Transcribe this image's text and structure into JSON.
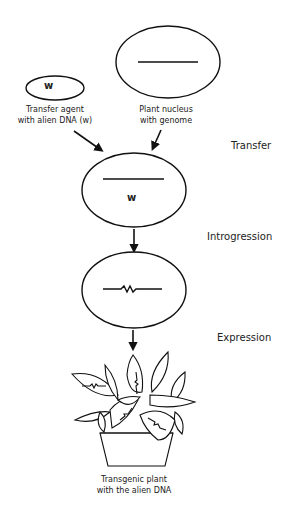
{
  "diagram": {
    "type": "process-flow",
    "nodes": {
      "transfer_agent": {
        "symbol": "w",
        "label_line1": "Transfer agent",
        "label_line2": "with alien DNA (w)"
      },
      "plant_nucleus": {
        "label_line1": "Plant nucleus",
        "label_line2": "with genome"
      },
      "after_transfer": {
        "symbol": "w"
      },
      "after_introgression": {},
      "transgenic_plant": {
        "label_line1": "Transgenic plant",
        "label_line2": "with the alien DNA"
      }
    },
    "steps": {
      "transfer": "Transfer",
      "introgression": "Introgression",
      "expression": "Expression"
    },
    "edges": [
      {
        "from": "transfer_agent",
        "to": "after_transfer"
      },
      {
        "from": "plant_nucleus",
        "to": "after_transfer"
      },
      {
        "from": "after_transfer",
        "to": "after_introgression",
        "label": "Introgression"
      },
      {
        "from": "after_introgression",
        "to": "transgenic_plant",
        "label": "Expression"
      }
    ],
    "colors": {
      "stroke": "#111111",
      "background": "#ffffff",
      "text": "#222222"
    }
  }
}
